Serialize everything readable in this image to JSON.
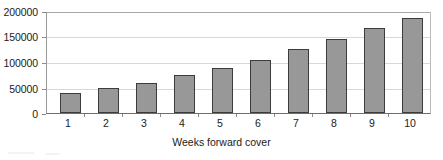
{
  "chart_data": {
    "type": "bar",
    "title": "",
    "xlabel": "Weeks forward cover",
    "ylabel": "",
    "categories": [
      "1",
      "2",
      "3",
      "4",
      "5",
      "6",
      "7",
      "8",
      "9",
      "10"
    ],
    "values": [
      40000,
      50000,
      60000,
      75000,
      90000,
      105000,
      128000,
      148000,
      170000,
      190000
    ],
    "series": [
      {
        "name": "Forward cover",
        "values": [
          40000,
          50000,
          60000,
          75000,
          90000,
          105000,
          128000,
          148000,
          170000,
          190000
        ]
      }
    ],
    "ylim": [
      0,
      200000
    ],
    "yticks": [
      0,
      50000,
      100000,
      150000,
      200000
    ],
    "ytick_labels": [
      "0",
      "50000",
      "100000",
      "150000",
      "200000"
    ],
    "grid": true,
    "grid_axis": "y",
    "legend": false,
    "legend_position": "none",
    "bar_color": "#989898",
    "bar_border_color": "#3c3c3c",
    "gridline_color": "#d8d8d8",
    "plot_border_color": "#b4b4b4",
    "text_color": "#1a1a1a",
    "background_color": "#ffffff"
  }
}
